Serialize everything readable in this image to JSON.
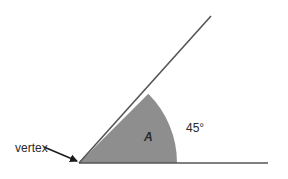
{
  "diagram": {
    "type": "angle",
    "vertex_label": "vertex",
    "angle_name": "A",
    "angle_measure": "45°",
    "colors": {
      "ray": "#555555",
      "sector_fill": "#8e8e8e",
      "text": "#2a2a2a",
      "arrow": "#1a1a1a"
    }
  }
}
